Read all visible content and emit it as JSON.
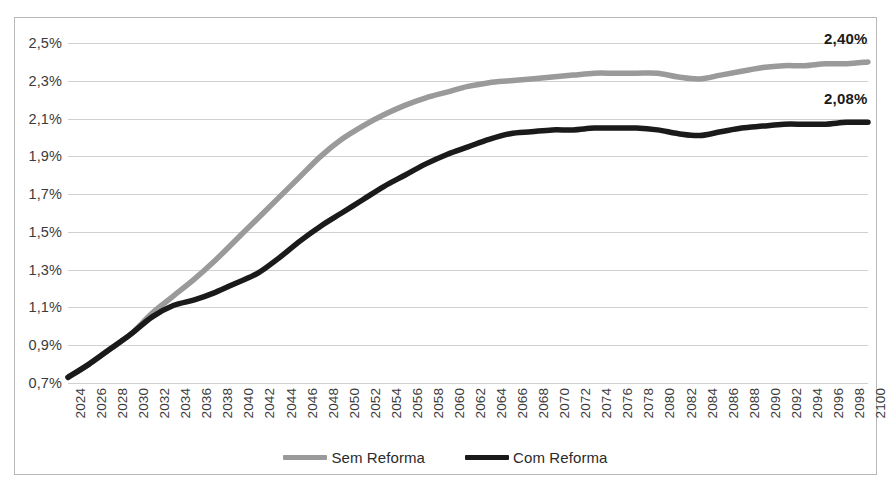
{
  "chart_data": {
    "type": "line",
    "title": "",
    "subtitle": "",
    "xlabel": "",
    "ylabel": "",
    "ylim": [
      0.7,
      2.5
    ],
    "ytick_values": [
      0.7,
      0.9,
      1.1,
      1.3,
      1.5,
      1.7,
      1.9,
      2.1,
      2.3,
      2.5
    ],
    "ytick_labels": [
      "0,7%",
      "0,9%",
      "1,1%",
      "1,3%",
      "1,5%",
      "1,7%",
      "1,9%",
      "2,1%",
      "2,3%",
      "2,5%"
    ],
    "grid": true,
    "legend_position": "bottom-center",
    "x_tick_step": 2,
    "categories": [
      "2024",
      "2026",
      "2028",
      "2030",
      "2032",
      "2034",
      "2036",
      "2038",
      "2040",
      "2042",
      "2044",
      "2046",
      "2048",
      "2050",
      "2052",
      "2054",
      "2056",
      "2058",
      "2060",
      "2062",
      "2064",
      "2066",
      "2068",
      "2070",
      "2072",
      "2074",
      "2076",
      "2078",
      "2080",
      "2082",
      "2084",
      "2086",
      "2088",
      "2090",
      "2092",
      "2094",
      "2096",
      "2098",
      "2100"
    ],
    "series": [
      {
        "name": "Sem Reforma",
        "color": "#9a9a9a",
        "end_label": "2,40%",
        "values": [
          0.73,
          0.8,
          0.88,
          0.96,
          1.07,
          1.16,
          1.25,
          1.35,
          1.46,
          1.57,
          1.68,
          1.79,
          1.9,
          1.99,
          2.06,
          2.12,
          2.17,
          2.21,
          2.24,
          2.27,
          2.29,
          2.3,
          2.31,
          2.32,
          2.33,
          2.34,
          2.34,
          2.34,
          2.34,
          2.32,
          2.31,
          2.33,
          2.35,
          2.37,
          2.38,
          2.38,
          2.39,
          2.39,
          2.4
        ]
      },
      {
        "name": "Com Reforma",
        "color": "#1a1a1a",
        "end_label": "2,08%",
        "values": [
          0.73,
          0.8,
          0.88,
          0.96,
          1.05,
          1.11,
          1.14,
          1.18,
          1.23,
          1.28,
          1.36,
          1.45,
          1.53,
          1.6,
          1.67,
          1.74,
          1.8,
          1.86,
          1.91,
          1.95,
          1.99,
          2.02,
          2.03,
          2.04,
          2.04,
          2.05,
          2.05,
          2.05,
          2.04,
          2.02,
          2.01,
          2.03,
          2.05,
          2.06,
          2.07,
          2.07,
          2.07,
          2.08,
          2.08
        ]
      }
    ]
  },
  "legend": {
    "entries": [
      {
        "label": "Sem Reforma",
        "color": "#9a9a9a"
      },
      {
        "label": "Com Reforma",
        "color": "#1a1a1a"
      }
    ]
  }
}
